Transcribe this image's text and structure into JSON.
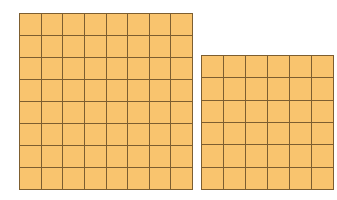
{
  "colors": {
    "fill": "#f9c46e",
    "line": "#7d5e30"
  },
  "grids": [
    {
      "name": "left-grid",
      "cols": 8,
      "rows": 8,
      "x": 19,
      "y": 13,
      "width": 174,
      "height": 177
    },
    {
      "name": "right-grid",
      "cols": 6,
      "rows": 6,
      "x": 201,
      "y": 55,
      "width": 133,
      "height": 135
    }
  ]
}
